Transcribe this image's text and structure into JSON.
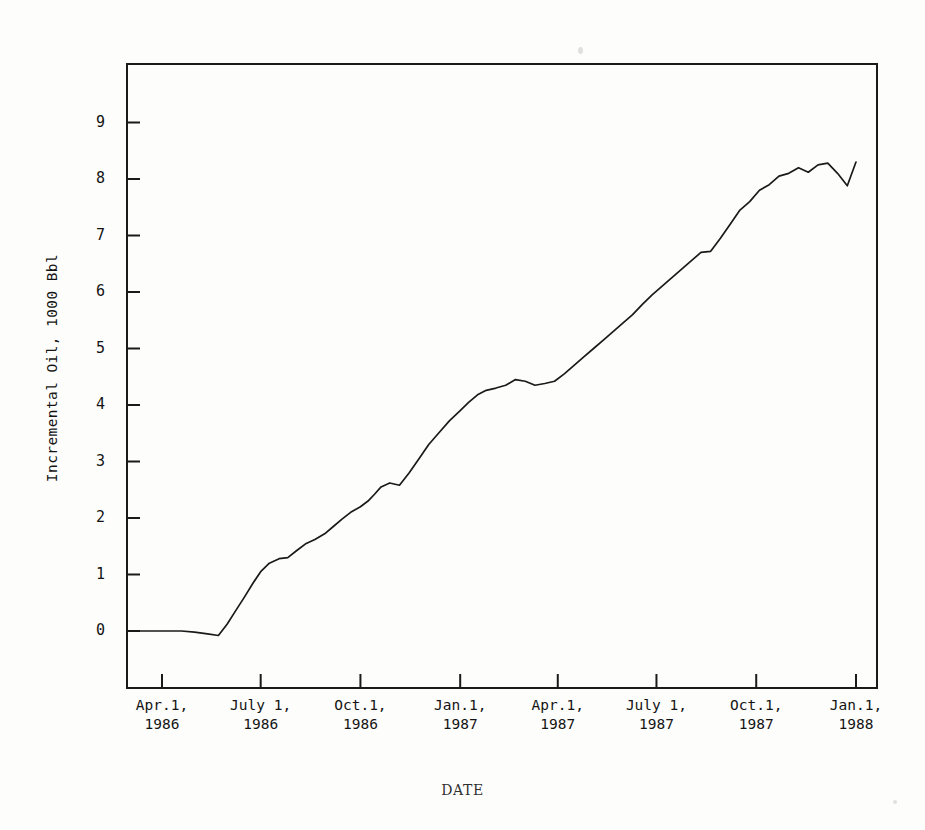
{
  "figure": {
    "background_color": "#fdfdfb",
    "ink_color": "#1a1a1a"
  },
  "axis_titles": {
    "y": "Incremental Oil, 1000 Bbl",
    "x": "DATE"
  },
  "y_ticks": [
    {
      "label": "0",
      "value": 0
    },
    {
      "label": "1",
      "value": 1
    },
    {
      "label": "2",
      "value": 2
    },
    {
      "label": "3",
      "value": 3
    },
    {
      "label": "4",
      "value": 4
    },
    {
      "label": "5",
      "value": 5
    },
    {
      "label": "6",
      "value": 6
    },
    {
      "label": "7",
      "value": 7
    },
    {
      "label": "8",
      "value": 8
    },
    {
      "label": "9",
      "value": 9
    }
  ],
  "x_ticks": [
    {
      "line1": "Apr.1,",
      "line2": "1986",
      "value": 0
    },
    {
      "line1": "July 1,",
      "line2": "1986",
      "value": 91
    },
    {
      "line1": "Oct.1,",
      "line2": "1986",
      "value": 183
    },
    {
      "line1": "Jan.1,",
      "line2": "1987",
      "value": 275
    },
    {
      "line1": "Apr.1,",
      "line2": "1987",
      "value": 365
    },
    {
      "line1": "July 1,",
      "line2": "1987",
      "value": 456
    },
    {
      "line1": "Oct.1,",
      "line2": "1987",
      "value": 548
    },
    {
      "line1": "Jan.1,",
      "line2": "1988",
      "value": 640
    }
  ],
  "chart_data": {
    "type": "line",
    "title": "",
    "xlabel": "DATE",
    "ylabel": "Incremental Oil, 1000 Bbl",
    "xlim": [
      -31,
      670
    ],
    "ylim": [
      -0.35,
      9.7
    ],
    "grid": false,
    "legend": null,
    "x_tick_labels": [
      "Apr.1, 1986",
      "July 1, 1986",
      "Oct.1, 1986",
      "Jan.1, 1987",
      "Apr.1, 1987",
      "July 1, 1987",
      "Oct.1, 1987",
      "Jan.1, 1988"
    ],
    "y_tick_labels": [
      "0",
      "1",
      "2",
      "3",
      "4",
      "5",
      "6",
      "7",
      "8",
      "9"
    ],
    "series": [
      {
        "name": "Incremental Oil",
        "x": [
          -31,
          -10,
          5,
          18,
          30,
          42,
          52,
          60,
          68,
          76,
          84,
          91,
          99,
          108,
          116,
          124,
          133,
          141,
          150,
          158,
          166,
          174,
          183,
          190,
          196,
          202,
          210,
          219,
          228,
          237,
          246,
          255,
          265,
          275,
          283,
          291,
          299,
          308,
          317,
          326,
          335,
          344,
          353,
          362,
          371,
          380,
          389,
          398,
          407,
          416,
          425,
          434,
          443,
          452,
          461,
          470,
          479,
          488,
          497,
          506,
          515,
          524,
          533,
          542,
          551,
          560,
          569,
          578,
          587,
          596,
          605,
          614,
          623,
          632,
          640
        ],
        "y": [
          0.0,
          0.0,
          0.0,
          0.0,
          -0.02,
          -0.05,
          -0.08,
          0.12,
          0.36,
          0.6,
          0.85,
          1.05,
          1.2,
          1.28,
          1.3,
          1.42,
          1.55,
          1.62,
          1.72,
          1.85,
          1.98,
          2.1,
          2.2,
          2.3,
          2.42,
          2.55,
          2.62,
          2.58,
          2.8,
          3.05,
          3.3,
          3.5,
          3.72,
          3.9,
          4.05,
          4.18,
          4.26,
          4.3,
          4.35,
          4.45,
          4.42,
          4.35,
          4.38,
          4.42,
          4.55,
          4.7,
          4.85,
          5.0,
          5.15,
          5.3,
          5.45,
          5.6,
          5.78,
          5.95,
          6.1,
          6.25,
          6.4,
          6.55,
          6.7,
          6.72,
          6.95,
          7.2,
          7.45,
          7.6,
          7.8,
          7.9,
          8.05,
          8.1,
          8.2,
          8.12,
          8.25,
          8.28,
          8.1,
          7.88,
          8.3
        ],
        "color": "#1a1a1a",
        "linewidth": 1.7,
        "marker": "none"
      }
    ]
  },
  "plot_geometry": {
    "frame_left": 127,
    "frame_right": 877,
    "frame_top": 64,
    "frame_bottom": 688,
    "y0_pixel": 631,
    "y_unit_pixels": 56.5,
    "x_origin_pixel": 162,
    "x_quarter_pixels": 99
  }
}
